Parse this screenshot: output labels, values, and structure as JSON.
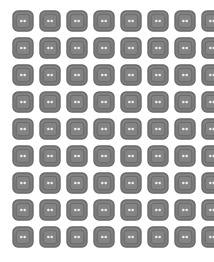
{
  "page": {
    "background_color": "#ffffff",
    "width": 214,
    "height": 262
  },
  "grid": {
    "columns": 8,
    "rows": 9,
    "total_icons": 72,
    "icon_size": 22,
    "gap": 5,
    "offset_x": 12,
    "offset_y": 10
  },
  "icon": {
    "name": "two-hole-button-icon",
    "description": "rounded square button with inner rounded frame and two dots",
    "outer_fill": "#7c7c7c",
    "outer_stroke": "#6a6a6a",
    "inner_stroke": "#6e6e6e",
    "inner_fill": "#848484",
    "dot_fill": "#efefef",
    "highlight": "#9a9a9a",
    "dot_count": 2
  },
  "icons": [
    {
      "id": 1,
      "row": 1,
      "col": 1,
      "label": "button-icon-1"
    },
    {
      "id": 2,
      "row": 1,
      "col": 2,
      "label": "button-icon-2"
    },
    {
      "id": 3,
      "row": 1,
      "col": 3,
      "label": "button-icon-3"
    },
    {
      "id": 4,
      "row": 1,
      "col": 4,
      "label": "button-icon-4"
    },
    {
      "id": 5,
      "row": 1,
      "col": 5,
      "label": "button-icon-5"
    },
    {
      "id": 6,
      "row": 1,
      "col": 6,
      "label": "button-icon-6"
    },
    {
      "id": 7,
      "row": 1,
      "col": 7,
      "label": "button-icon-7"
    },
    {
      "id": 8,
      "row": 1,
      "col": 8,
      "label": "button-icon-8"
    },
    {
      "id": 9,
      "row": 2,
      "col": 1,
      "label": "button-icon-9"
    },
    {
      "id": 10,
      "row": 2,
      "col": 2,
      "label": "button-icon-10"
    },
    {
      "id": 11,
      "row": 2,
      "col": 3,
      "label": "button-icon-11"
    },
    {
      "id": 12,
      "row": 2,
      "col": 4,
      "label": "button-icon-12"
    },
    {
      "id": 13,
      "row": 2,
      "col": 5,
      "label": "button-icon-13"
    },
    {
      "id": 14,
      "row": 2,
      "col": 6,
      "label": "button-icon-14"
    },
    {
      "id": 15,
      "row": 2,
      "col": 7,
      "label": "button-icon-15"
    },
    {
      "id": 16,
      "row": 2,
      "col": 8,
      "label": "button-icon-16"
    },
    {
      "id": 17,
      "row": 3,
      "col": 1,
      "label": "button-icon-17"
    },
    {
      "id": 18,
      "row": 3,
      "col": 2,
      "label": "button-icon-18"
    },
    {
      "id": 19,
      "row": 3,
      "col": 3,
      "label": "button-icon-19"
    },
    {
      "id": 20,
      "row": 3,
      "col": 4,
      "label": "button-icon-20"
    },
    {
      "id": 21,
      "row": 3,
      "col": 5,
      "label": "button-icon-21"
    },
    {
      "id": 22,
      "row": 3,
      "col": 6,
      "label": "button-icon-22"
    },
    {
      "id": 23,
      "row": 3,
      "col": 7,
      "label": "button-icon-23"
    },
    {
      "id": 24,
      "row": 3,
      "col": 8,
      "label": "button-icon-24"
    },
    {
      "id": 25,
      "row": 4,
      "col": 1,
      "label": "button-icon-25"
    },
    {
      "id": 26,
      "row": 4,
      "col": 2,
      "label": "button-icon-26"
    },
    {
      "id": 27,
      "row": 4,
      "col": 3,
      "label": "button-icon-27"
    },
    {
      "id": 28,
      "row": 4,
      "col": 4,
      "label": "button-icon-28"
    },
    {
      "id": 29,
      "row": 4,
      "col": 5,
      "label": "button-icon-29"
    },
    {
      "id": 30,
      "row": 4,
      "col": 6,
      "label": "button-icon-30"
    },
    {
      "id": 31,
      "row": 4,
      "col": 7,
      "label": "button-icon-31"
    },
    {
      "id": 32,
      "row": 4,
      "col": 8,
      "label": "button-icon-32"
    },
    {
      "id": 33,
      "row": 5,
      "col": 1,
      "label": "button-icon-33"
    },
    {
      "id": 34,
      "row": 5,
      "col": 2,
      "label": "button-icon-34"
    },
    {
      "id": 35,
      "row": 5,
      "col": 3,
      "label": "button-icon-35"
    },
    {
      "id": 36,
      "row": 5,
      "col": 4,
      "label": "button-icon-36"
    },
    {
      "id": 37,
      "row": 5,
      "col": 5,
      "label": "button-icon-37"
    },
    {
      "id": 38,
      "row": 5,
      "col": 6,
      "label": "button-icon-38"
    },
    {
      "id": 39,
      "row": 5,
      "col": 7,
      "label": "button-icon-39"
    },
    {
      "id": 40,
      "row": 5,
      "col": 8,
      "label": "button-icon-40"
    },
    {
      "id": 41,
      "row": 6,
      "col": 1,
      "label": "button-icon-41"
    },
    {
      "id": 42,
      "row": 6,
      "col": 2,
      "label": "button-icon-42"
    },
    {
      "id": 43,
      "row": 6,
      "col": 3,
      "label": "button-icon-43"
    },
    {
      "id": 44,
      "row": 6,
      "col": 4,
      "label": "button-icon-44"
    },
    {
      "id": 45,
      "row": 6,
      "col": 5,
      "label": "button-icon-45"
    },
    {
      "id": 46,
      "row": 6,
      "col": 6,
      "label": "button-icon-46"
    },
    {
      "id": 47,
      "row": 6,
      "col": 7,
      "label": "button-icon-47"
    },
    {
      "id": 48,
      "row": 6,
      "col": 8,
      "label": "button-icon-48"
    },
    {
      "id": 49,
      "row": 7,
      "col": 1,
      "label": "button-icon-49"
    },
    {
      "id": 50,
      "row": 7,
      "col": 2,
      "label": "button-icon-50"
    },
    {
      "id": 51,
      "row": 7,
      "col": 3,
      "label": "button-icon-51"
    },
    {
      "id": 52,
      "row": 7,
      "col": 4,
      "label": "button-icon-52"
    },
    {
      "id": 53,
      "row": 7,
      "col": 5,
      "label": "button-icon-53"
    },
    {
      "id": 54,
      "row": 7,
      "col": 6,
      "label": "button-icon-54"
    },
    {
      "id": 55,
      "row": 7,
      "col": 7,
      "label": "button-icon-55"
    },
    {
      "id": 56,
      "row": 7,
      "col": 8,
      "label": "button-icon-56"
    },
    {
      "id": 57,
      "row": 8,
      "col": 1,
      "label": "button-icon-57"
    },
    {
      "id": 58,
      "row": 8,
      "col": 2,
      "label": "button-icon-58"
    },
    {
      "id": 59,
      "row": 8,
      "col": 3,
      "label": "button-icon-59"
    },
    {
      "id": 60,
      "row": 8,
      "col": 4,
      "label": "button-icon-60"
    },
    {
      "id": 61,
      "row": 8,
      "col": 5,
      "label": "button-icon-61"
    },
    {
      "id": 62,
      "row": 8,
      "col": 6,
      "label": "button-icon-62"
    },
    {
      "id": 63,
      "row": 8,
      "col": 7,
      "label": "button-icon-63"
    },
    {
      "id": 64,
      "row": 8,
      "col": 8,
      "label": "button-icon-64"
    },
    {
      "id": 65,
      "row": 9,
      "col": 1,
      "label": "button-icon-65"
    },
    {
      "id": 66,
      "row": 9,
      "col": 2,
      "label": "button-icon-66"
    },
    {
      "id": 67,
      "row": 9,
      "col": 3,
      "label": "button-icon-67"
    },
    {
      "id": 68,
      "row": 9,
      "col": 4,
      "label": "button-icon-68"
    },
    {
      "id": 69,
      "row": 9,
      "col": 5,
      "label": "button-icon-69"
    },
    {
      "id": 70,
      "row": 9,
      "col": 6,
      "label": "button-icon-70"
    },
    {
      "id": 71,
      "row": 9,
      "col": 7,
      "label": "button-icon-71"
    },
    {
      "id": 72,
      "row": 9,
      "col": 8,
      "label": "button-icon-72"
    }
  ]
}
